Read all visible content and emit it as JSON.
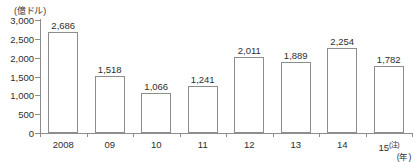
{
  "chart_data": {
    "type": "bar",
    "title": "",
    "top_clipped_text": "",
    "unit_label": "(億ドル)",
    "xlabel": "(年)",
    "ylabel": "",
    "categories": [
      "2008",
      "09",
      "10",
      "11",
      "12",
      "13",
      "14",
      "15"
    ],
    "category_note_suffix": "(注)",
    "values": [
      2686,
      1518,
      1066,
      1241,
      2011,
      1889,
      2254,
      1782
    ],
    "value_labels": [
      "2,686",
      "1,518",
      "1,066",
      "1,241",
      "2,011",
      "1,889",
      "2,254",
      "1,782"
    ],
    "ylim": [
      0,
      3000
    ],
    "ytick_values": [
      3000,
      2500,
      2000,
      1500,
      1000,
      500,
      0
    ],
    "ytick_labels": [
      "3,000",
      "2,500",
      "2,000",
      "1,500",
      "1,000",
      "500",
      "0"
    ],
    "grid": false,
    "legend": null,
    "bar_fill_color": "#ffffff",
    "bar_border_color": "#8d8d8d",
    "axis_color": "#8d8d8d",
    "text_color": "#2e2e2e"
  }
}
